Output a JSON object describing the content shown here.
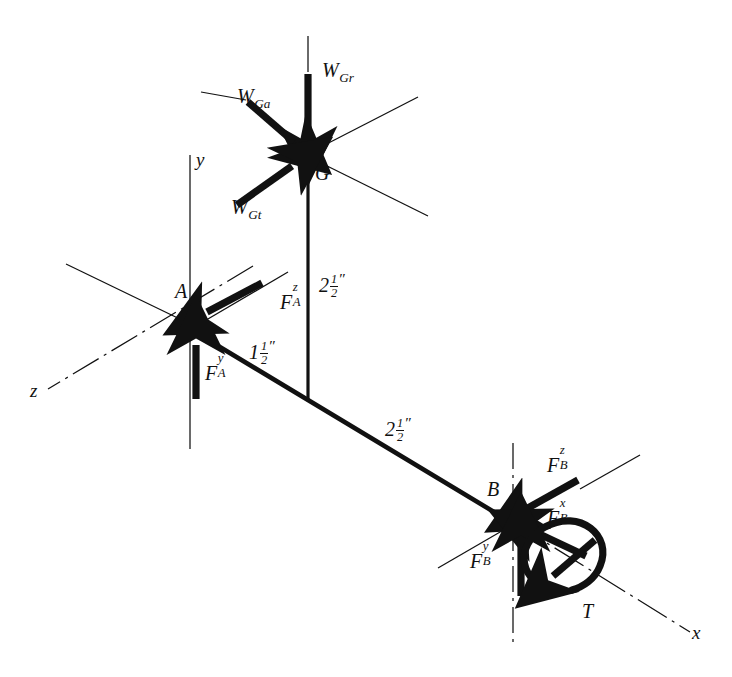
{
  "figure": {
    "kind": "free-body-diagram",
    "stroke_color": "#111111",
    "background_color": "#ffffff"
  },
  "axes": [
    {
      "name": "x-axis",
      "label": "x",
      "style": "dash-dot",
      "direction": "lower-right"
    },
    {
      "name": "y-axis",
      "label": "y",
      "style": "solid-thin",
      "direction": "vertical"
    },
    {
      "name": "z-axis",
      "label": "z",
      "style": "dash-dot",
      "direction": "lower-left"
    }
  ],
  "points": [
    {
      "name": "bearing-A",
      "label": "A"
    },
    {
      "name": "bearing-B",
      "label": "B"
    },
    {
      "name": "gear-center-G",
      "label": "G"
    }
  ],
  "forces": [
    {
      "name": "gear-radial-force",
      "base": "W",
      "sub": "Gr",
      "sup": "",
      "label": "W_Gr"
    },
    {
      "name": "gear-axial-force",
      "base": "W",
      "sub": "Ga",
      "sup": "",
      "label": "W_Ga"
    },
    {
      "name": "gear-tangential-force",
      "base": "W",
      "sub": "Gt",
      "sup": "",
      "label": "W_Gt"
    },
    {
      "name": "bearing-A-force-z",
      "base": "F",
      "sub": "A",
      "sup": "z",
      "label": "F_A^z"
    },
    {
      "name": "bearing-A-force-y",
      "base": "F",
      "sub": "A",
      "sup": "y",
      "label": "F_A^y"
    },
    {
      "name": "bearing-B-force-z",
      "base": "F",
      "sub": "B",
      "sup": "z",
      "label": "F_B^z"
    },
    {
      "name": "bearing-B-force-x",
      "base": "F",
      "sub": "B",
      "sup": "x",
      "label": "F_B^x"
    },
    {
      "name": "bearing-B-force-y",
      "base": "F",
      "sub": "B",
      "sup": "y",
      "label": "F_B^y"
    }
  ],
  "torque": {
    "name": "torque-T",
    "label": "T"
  },
  "dimensions": [
    {
      "name": "dim-G-to-shaft",
      "whole": "2",
      "numerator": "1",
      "denominator": "2",
      "unit": "″",
      "text": "2 1/2″"
    },
    {
      "name": "dim-A-to-gear-station",
      "whole": "1",
      "numerator": "1",
      "denominator": "2",
      "unit": "″",
      "text": "1 1/2″"
    },
    {
      "name": "dim-gear-station-to-B",
      "whole": "2",
      "numerator": "1",
      "denominator": "2",
      "unit": "″",
      "text": "2 1/2″"
    }
  ]
}
